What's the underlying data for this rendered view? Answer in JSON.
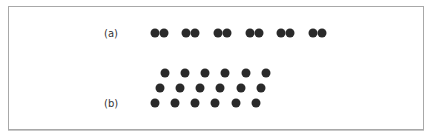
{
  "figure": {
    "panel_a": {
      "label": "(a)",
      "label_pos": [
        108,
        33
      ],
      "description": "Six pairs of dots in a single row (grouping by proximity)",
      "dot_color": "#2a2a2a",
      "dot_diameter": 9,
      "row_y": 33,
      "pairs_x": [
        [
          155,
          164
        ],
        [
          186,
          195
        ],
        [
          218,
          227
        ],
        [
          250,
          259
        ],
        [
          281,
          290
        ],
        [
          313,
          322
        ]
      ]
    },
    "panel_b": {
      "label": "(b)",
      "label_pos": [
        108,
        103
      ],
      "description": "Three rows of six evenly spaced dots, each row offset to the left (diagonal grouping)",
      "dot_color": "#2a2a2a",
      "dot_diameter": 9,
      "rows": [
        {
          "y": 73,
          "x": [
            165,
            185,
            205,
            225,
            246,
            266
          ]
        },
        {
          "y": 88,
          "x": [
            160,
            180,
            200,
            220,
            241,
            261
          ]
        },
        {
          "y": 103,
          "x": [
            155,
            175,
            195,
            215,
            236,
            256
          ]
        }
      ]
    },
    "frame_border_color": "#a8a8a8"
  }
}
